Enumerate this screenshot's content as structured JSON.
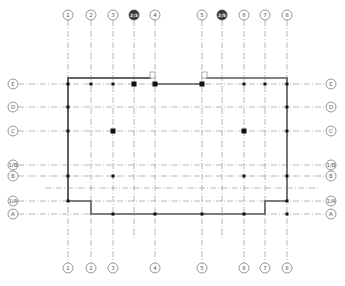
{
  "drawing": {
    "type": "structural grid / column layout plan",
    "vertical_axes": [
      {
        "id": "v1",
        "label": "1",
        "style": "normal",
        "top": true,
        "bottom": true
      },
      {
        "id": "v2",
        "label": "2",
        "style": "normal",
        "top": true,
        "bottom": true
      },
      {
        "id": "v3",
        "label": "3",
        "style": "normal",
        "top": true,
        "bottom": true
      },
      {
        "id": "v25a",
        "label": "2/3",
        "style": "dark",
        "top": true,
        "bottom": false
      },
      {
        "id": "v4",
        "label": "4",
        "style": "normal",
        "top": true,
        "bottom": true
      },
      {
        "id": "v5",
        "label": "5",
        "style": "normal",
        "top": true,
        "bottom": true
      },
      {
        "id": "v25b",
        "label": "2/5",
        "style": "dark",
        "top": true,
        "bottom": false
      },
      {
        "id": "v6",
        "label": "6",
        "style": "normal",
        "top": true,
        "bottom": true
      },
      {
        "id": "v7",
        "label": "7",
        "style": "normal",
        "top": true,
        "bottom": true
      },
      {
        "id": "v8",
        "label": "8",
        "style": "normal",
        "top": true,
        "bottom": true
      }
    ],
    "horizontal_axes": [
      {
        "id": "hE",
        "label": "E",
        "labeled": true
      },
      {
        "id": "hD",
        "label": "D",
        "labeled": true
      },
      {
        "id": "hC",
        "label": "C",
        "labeled": true
      },
      {
        "id": "h1B",
        "label": "1/B",
        "labeled": true
      },
      {
        "id": "hB",
        "label": "B",
        "labeled": true
      },
      {
        "id": "hX",
        "label": "",
        "labeled": false
      },
      {
        "id": "h1A",
        "label": "1/A",
        "labeled": true
      },
      {
        "id": "hA",
        "label": "A",
        "labeled": true
      }
    ],
    "columns": [
      {
        "v": "v1",
        "h": "hE",
        "size": "small"
      },
      {
        "v": "v2",
        "h": "hE",
        "size": "small"
      },
      {
        "v": "v3",
        "h": "hE",
        "size": "small"
      },
      {
        "v": "v25a",
        "h": "hE",
        "size": "large"
      },
      {
        "v": "v4",
        "h": "hE",
        "size": "large"
      },
      {
        "v": "v5",
        "h": "hE",
        "size": "large"
      },
      {
        "v": "v6",
        "h": "hE",
        "size": "small"
      },
      {
        "v": "v7",
        "h": "hE",
        "size": "small"
      },
      {
        "v": "v8",
        "h": "hE",
        "size": "small"
      },
      {
        "v": "v1",
        "h": "hD",
        "size": "small"
      },
      {
        "v": "v8",
        "h": "hD",
        "size": "small"
      },
      {
        "v": "v1",
        "h": "hC",
        "size": "small"
      },
      {
        "v": "v3",
        "h": "hC",
        "size": "large"
      },
      {
        "v": "v6",
        "h": "hC",
        "size": "large"
      },
      {
        "v": "v8",
        "h": "hC",
        "size": "small"
      },
      {
        "v": "v1",
        "h": "hB",
        "size": "small"
      },
      {
        "v": "v3",
        "h": "hB",
        "size": "small"
      },
      {
        "v": "v6",
        "h": "hB",
        "size": "small"
      },
      {
        "v": "v8",
        "h": "hB",
        "size": "small"
      },
      {
        "v": "v1",
        "h": "h1A",
        "size": "small"
      },
      {
        "v": "v8",
        "h": "h1A",
        "size": "small"
      },
      {
        "v": "v3",
        "h": "hA",
        "size": "small"
      },
      {
        "v": "v4",
        "h": "hA",
        "size": "small"
      },
      {
        "v": "v5",
        "h": "hA",
        "size": "small"
      },
      {
        "v": "v6",
        "h": "hA",
        "size": "small"
      },
      {
        "v": "v8",
        "h": "hA",
        "size": "small"
      }
    ]
  }
}
